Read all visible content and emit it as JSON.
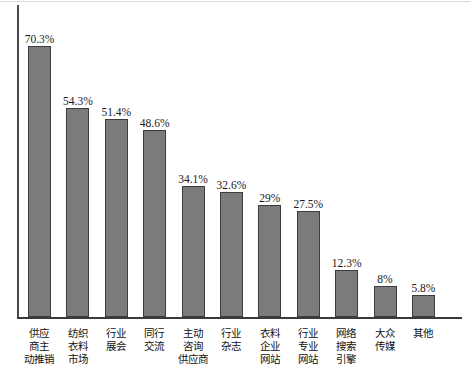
{
  "chart_data": {
    "type": "bar",
    "title": "",
    "xlabel": "",
    "ylabel": "",
    "grid": false,
    "legend": "none",
    "ylim": [
      0,
      80
    ],
    "categories": [
      "供应商主动推销",
      "纺织衣料市场",
      "行业展会",
      "同行交流",
      "主动咨询供应商",
      "行业杂志",
      "衣料企业网站",
      "行业专业网站",
      "网络搜索引擎",
      "大众传媒",
      "其他"
    ],
    "category_lines": [
      [
        "供应",
        "商主",
        "动推销"
      ],
      [
        "纺织",
        "衣料",
        "市场"
      ],
      [
        "行业",
        "展会"
      ],
      [
        "同行",
        "交流"
      ],
      [
        "主动",
        "咨询",
        "供应商"
      ],
      [
        "行业",
        "杂志"
      ],
      [
        "衣料",
        "企业",
        "网站"
      ],
      [
        "行业",
        "专业",
        "网站"
      ],
      [
        "网络",
        "搜索",
        "引擎"
      ],
      [
        "大众",
        "传媒"
      ],
      [
        "其他"
      ]
    ],
    "values": [
      70.3,
      54.3,
      51.4,
      48.6,
      34.1,
      32.6,
      29,
      27.5,
      12.3,
      8,
      5.8
    ],
    "value_labels": [
      "70.3%",
      "54.3%",
      "51.4%",
      "48.6%",
      "34.1%",
      "32.6%",
      "29%",
      "27.5%",
      "12.3%",
      "8%",
      "5.8%"
    ],
    "colors": {
      "bar_fill": "#7b7b7b",
      "bar_border": "#3c3c3c",
      "axis": "#3a3a3a",
      "label_text": "#1a1a1a",
      "background": "#ffffff"
    }
  }
}
